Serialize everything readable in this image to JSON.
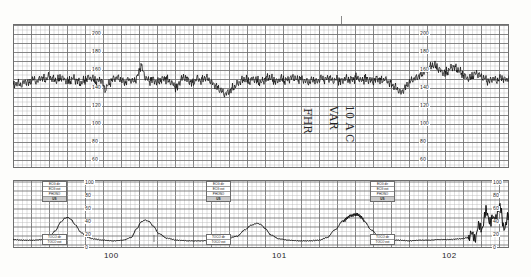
{
  "document": {
    "kind": "cardiotocograph-chart-paper",
    "paper_color": "#fdfdfb",
    "grid_color": "#b9b9b9",
    "grid_major_color": "#6f6f6f",
    "trace_color": "#101010"
  },
  "upper_panel": {
    "name": "fetal-heart-rate",
    "unit": "bpm",
    "y_ticks": [
      200,
      180,
      160,
      140,
      120,
      100,
      80,
      60
    ],
    "y_ticks_right": [
      200,
      180,
      160,
      140,
      120,
      100,
      80,
      60
    ],
    "ylim": [
      50,
      210
    ],
    "baseline_bpm": 150
  },
  "lower_panel": {
    "name": "uterine-activity-toco",
    "unit": "mmHg",
    "y_ticks": [
      100,
      80,
      60,
      40,
      20,
      0
    ],
    "y_ticks_right": [
      100,
      80,
      60,
      40,
      20,
      0
    ],
    "ylim": [
      0,
      100
    ]
  },
  "time_axis": {
    "labels": [
      "100",
      "101",
      "102"
    ],
    "label_x": [
      104,
      272,
      442
    ]
  },
  "mode_blocks": {
    "x_positions": [
      42,
      206,
      370
    ],
    "upper_rows": [
      "ECG dir",
      "ECG ext",
      "PHONO",
      "US"
    ],
    "selected_upper": "US",
    "lower_rows": [
      "TOCO dir",
      "TOCO ext"
    ]
  },
  "annotation": {
    "lines": [
      "FHR",
      "VAR",
      "10 A C"
    ],
    "note": "handwritten-rotated-marking"
  },
  "chart_data": {
    "type": "line",
    "xlabel": "Time (min, paper marks 100 / 101 / 102)",
    "grid": true,
    "legend": "none",
    "charts": [
      {
        "id": "fhr",
        "type": "line",
        "ylabel": "Fetal heart rate (bpm)",
        "ylim": [
          50,
          210
        ],
        "yticks": [
          60,
          80,
          100,
          120,
          140,
          160,
          180,
          200
        ],
        "baseline": 150,
        "variability_bpm": 12,
        "description": "Baseline ~150 bpm with moderate short-term variability; shallow dips to ~132-138 bpm near the mid-left, a brief deceleration to ~128 bpm at mid-strip, and small accelerations to ~168 bpm after the mid-strip mark.",
        "x": [
          0,
          4,
          8,
          12,
          16,
          20,
          24,
          28,
          32,
          36,
          40,
          44,
          48,
          52,
          56,
          60,
          64,
          68,
          72,
          76,
          80,
          84,
          88,
          92,
          96,
          100,
          104,
          108,
          112,
          116,
          120,
          124,
          128,
          132,
          136,
          140,
          144,
          148,
          152,
          156,
          160,
          164,
          168,
          172,
          176,
          180,
          184,
          188,
          192,
          196,
          200,
          204,
          208,
          212,
          216,
          220,
          224,
          228,
          232,
          236,
          240,
          244,
          248,
          252,
          256,
          260,
          264,
          268,
          272,
          276,
          280,
          284,
          288,
          292,
          296,
          300,
          304,
          308,
          312,
          316,
          320,
          324,
          328,
          332,
          336,
          340,
          344,
          348,
          352,
          356,
          360,
          364,
          368,
          372,
          376,
          380,
          384,
          388,
          392,
          396,
          400,
          404,
          408,
          412,
          416,
          420,
          424,
          428,
          432,
          436,
          440,
          444,
          448,
          452,
          456,
          460,
          464,
          468,
          472,
          476,
          480,
          484,
          488,
          492,
          496
        ],
        "y": [
          142,
          146,
          143,
          148,
          145,
          150,
          147,
          152,
          149,
          153,
          150,
          148,
          152,
          149,
          147,
          151,
          148,
          145,
          149,
          152,
          150,
          147,
          150,
          138,
          145,
          150,
          152,
          149,
          146,
          150,
          147,
          151,
          166,
          152,
          148,
          150,
          146,
          149,
          151,
          148,
          144,
          140,
          150,
          152,
          148,
          145,
          151,
          148,
          152,
          149,
          145,
          141,
          137,
          133,
          136,
          140,
          144,
          148,
          150,
          147,
          151,
          148,
          146,
          150,
          152,
          149,
          147,
          151,
          148,
          150,
          152,
          149,
          151,
          148,
          146,
          150,
          147,
          151,
          149,
          152,
          148,
          150,
          147,
          151,
          149,
          150,
          152,
          148,
          151,
          149,
          147,
          151,
          148,
          150,
          146,
          143,
          139,
          135,
          140,
          146,
          150,
          152,
          155,
          158,
          162,
          166,
          163,
          159,
          156,
          160,
          164,
          161,
          157,
          153,
          150,
          154,
          157,
          153,
          150,
          147,
          151,
          148,
          152,
          149,
          151
        ]
      },
      {
        "id": "toco",
        "type": "line",
        "ylabel": "Uterine activity (mmHg)",
        "ylim": [
          0,
          100
        ],
        "yticks": [
          0,
          20,
          40,
          60,
          80,
          100
        ],
        "resting_tone": 12,
        "description": "Four uterine contractions with peaks near 47, 43, 38 and 52 mmHg, resting tone about 10-14 mmHg; a noisy artefact burst appears at the far right edge.",
        "contraction_peaks_mmHg": [
          47,
          43,
          38,
          52
        ],
        "contraction_peak_x": [
          55,
          135,
          245,
          345
        ],
        "x": [
          0,
          10,
          20,
          30,
          36,
          42,
          48,
          52,
          55,
          58,
          62,
          68,
          74,
          80,
          90,
          100,
          110,
          118,
          124,
          128,
          132,
          136,
          140,
          146,
          154,
          164,
          176,
          188,
          200,
          212,
          224,
          232,
          238,
          244,
          248,
          252,
          258,
          266,
          276,
          286,
          296,
          306,
          314,
          322,
          330,
          338,
          344,
          348,
          352,
          358,
          366,
          376,
          386,
          396,
          406,
          416,
          426,
          436,
          446,
          456,
          462,
          468,
          474,
          480,
          486,
          492,
          498
        ],
        "y": [
          13,
          12,
          12,
          13,
          16,
          26,
          40,
          46,
          47,
          44,
          36,
          24,
          17,
          14,
          12,
          11,
          12,
          16,
          30,
          40,
          43,
          41,
          34,
          22,
          15,
          12,
          11,
          11,
          12,
          13,
          18,
          28,
          35,
          38,
          36,
          30,
          20,
          14,
          12,
          11,
          11,
          12,
          16,
          28,
          42,
          50,
          52,
          48,
          40,
          28,
          18,
          13,
          12,
          11,
          12,
          12,
          13,
          13,
          14,
          16,
          20,
          34,
          52,
          40,
          60,
          35,
          50
        ]
      }
    ]
  }
}
